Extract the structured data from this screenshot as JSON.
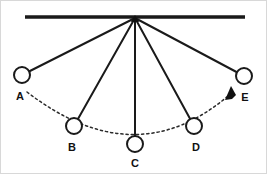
{
  "figure": {
    "background_color": "#ffffff",
    "line_color": "#1a1a1a",
    "arc_color": "#2b2b2b",
    "width": 267,
    "height": 174
  },
  "support": {
    "label": "support-bar",
    "x_start": 25,
    "x_end": 245,
    "y": 17,
    "thickness": 3.4
  },
  "pivot": {
    "label": "pivot-point",
    "x": 135,
    "y": 18
  },
  "bobs": [
    {
      "id": "A",
      "label": "A",
      "cx": 22,
      "cy": 75,
      "r": 8,
      "label_x": 20,
      "label_y": 97
    },
    {
      "id": "B",
      "label": "B",
      "cx": 74,
      "cy": 126,
      "r": 8,
      "label_x": 72,
      "label_y": 148
    },
    {
      "id": "C",
      "label": "C",
      "cx": 135,
      "cy": 144,
      "r": 8,
      "label_x": 135,
      "label_y": 164
    },
    {
      "id": "D",
      "label": "D",
      "cx": 194,
      "cy": 126,
      "r": 8,
      "label_x": 196,
      "label_y": 148
    },
    {
      "id": "E",
      "label": "E",
      "cx": 244,
      "cy": 76,
      "r": 8,
      "label_x": 245,
      "label_y": 98
    }
  ],
  "strings": [
    {
      "id": "string-A",
      "x1": 135,
      "y1": 18,
      "x2": 22,
      "y2": 75
    },
    {
      "id": "string-B",
      "x1": 135,
      "y1": 18,
      "x2": 74,
      "y2": 126
    },
    {
      "id": "string-C",
      "x1": 135,
      "y1": 18,
      "x2": 135,
      "y2": 144
    },
    {
      "id": "string-D",
      "x1": 135,
      "y1": 18,
      "x2": 194,
      "y2": 126
    },
    {
      "id": "string-E",
      "x1": 135,
      "y1": 18,
      "x2": 244,
      "y2": 76
    }
  ],
  "arc": {
    "label": "swing-trajectory-arc",
    "path": "M 27 92 Q 135 175 228 96",
    "style": "dashed"
  },
  "arrow": {
    "label": "direction-of-motion-arrow",
    "points": "231,86 225,100 232,99 236,95",
    "direction": "toward-E"
  },
  "chart_data": {
    "type": "scatter",
    "xlabel": "",
    "ylabel": "",
    "categories": [
      "A",
      "B",
      "C",
      "D",
      "E"
    ],
    "x": [
      22,
      74,
      135,
      194,
      244
    ],
    "y": [
      75,
      126,
      144,
      126,
      76
    ],
    "annotations": [
      "Horizontal support bar at top",
      "Single pivot point with five strings",
      "Dashed arc traces the swing path",
      "Arrowhead near E indicates direction of motion"
    ]
  }
}
